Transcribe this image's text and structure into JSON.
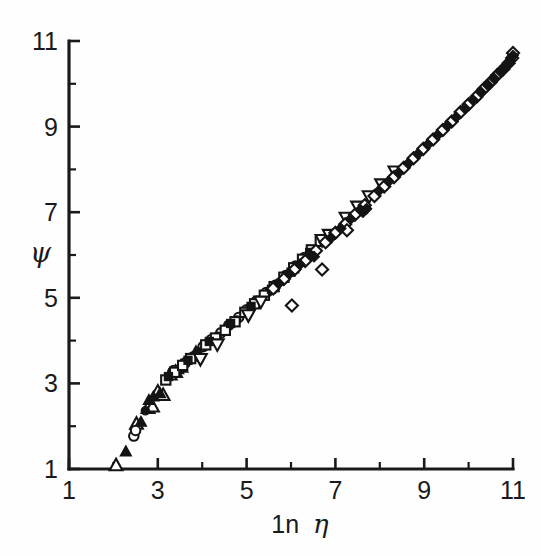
{
  "figure": {
    "background_color": "#fefefe",
    "ink_color": "#1a1a1a"
  },
  "chart_data": {
    "type": "scatter",
    "title": "",
    "subtitle": "",
    "xlabel": "1n η",
    "ylabel": "ψ",
    "xlim": [
      1,
      11
    ],
    "ylim": [
      1,
      11
    ],
    "x_major_ticks": [
      1,
      3,
      5,
      7,
      9,
      11
    ],
    "x_minor_ticks": [
      2,
      4,
      6,
      8,
      10
    ],
    "y_major_ticks": [
      1,
      3,
      5,
      7,
      9,
      11
    ],
    "y_minor_ticks": [
      2,
      4,
      6,
      8,
      10
    ],
    "x_tick_labels": [
      "1",
      "3",
      "5",
      "7",
      "9",
      "11"
    ],
    "y_tick_labels": [
      "1",
      "3",
      "5",
      "7",
      "9",
      "11"
    ],
    "grid": false,
    "legend": null,
    "legend_position": "none",
    "annotations": [],
    "marker_types": [
      "open-triangle-up",
      "filled-triangle-up",
      "open-circle",
      "filled-circle",
      "open-square",
      "filled-square",
      "open-diamond",
      "filled-diamond",
      "open-triangle-down"
    ],
    "series": [
      {
        "name": "open-triangle-up",
        "marker": "open-triangle-up",
        "points": [
          [
            2.06,
            1.1
          ],
          [
            2.52,
            2.07
          ],
          [
            2.78,
            2.44
          ],
          [
            2.88,
            2.47
          ],
          [
            3.0,
            2.82
          ],
          [
            3.12,
            2.74
          ],
          [
            3.28,
            3.22
          ],
          [
            3.4,
            3.28
          ],
          [
            3.52,
            3.4
          ],
          [
            3.86,
            3.72
          ]
        ]
      },
      {
        "name": "filled-triangle-up",
        "marker": "filled-triangle-up",
        "points": [
          [
            2.28,
            1.42
          ],
          [
            2.62,
            2.11
          ],
          [
            2.8,
            2.62
          ],
          [
            2.9,
            2.7
          ],
          [
            3.05,
            2.78
          ],
          [
            3.3,
            3.26
          ],
          [
            3.46,
            3.34
          ]
        ]
      },
      {
        "name": "open-circle",
        "marker": "open-circle",
        "points": [
          [
            2.46,
            1.77
          ],
          [
            2.5,
            1.9
          ],
          [
            3.36,
            3.3
          ],
          [
            3.62,
            3.48
          ],
          [
            3.8,
            3.62
          ],
          [
            4.02,
            3.86
          ],
          [
            4.2,
            4.02
          ],
          [
            4.42,
            4.18
          ],
          [
            4.6,
            4.36
          ],
          [
            4.82,
            4.54
          ],
          [
            5.0,
            4.72
          ],
          [
            5.22,
            4.92
          ],
          [
            5.44,
            5.12
          ],
          [
            5.66,
            5.3
          ],
          [
            5.88,
            5.52
          ],
          [
            6.1,
            5.74
          ],
          [
            6.3,
            5.94
          ]
        ]
      },
      {
        "name": "filled-circle",
        "marker": "filled-circle",
        "points": [
          [
            2.72,
            2.36
          ],
          [
            3.32,
            3.28
          ],
          [
            3.9,
            3.74
          ],
          [
            4.12,
            3.94
          ],
          [
            4.34,
            4.1
          ],
          [
            4.56,
            4.3
          ],
          [
            4.78,
            4.48
          ],
          [
            5.02,
            4.7
          ],
          [
            5.26,
            4.94
          ],
          [
            5.5,
            5.14
          ],
          [
            5.74,
            5.36
          ],
          [
            5.98,
            5.58
          ]
        ]
      },
      {
        "name": "open-square",
        "marker": "open-square",
        "points": [
          [
            3.18,
            3.08
          ],
          [
            3.38,
            3.26
          ],
          [
            3.56,
            3.42
          ],
          [
            3.74,
            3.58
          ],
          [
            4.08,
            3.9
          ],
          [
            4.3,
            4.06
          ],
          [
            4.52,
            4.24
          ],
          [
            4.74,
            4.44
          ],
          [
            4.96,
            4.66
          ],
          [
            5.18,
            4.86
          ],
          [
            5.4,
            5.06
          ],
          [
            5.62,
            5.26
          ],
          [
            5.84,
            5.48
          ],
          [
            6.06,
            5.7
          ],
          [
            6.26,
            5.9
          ],
          [
            6.46,
            6.12
          ],
          [
            6.66,
            6.32
          ]
        ]
      },
      {
        "name": "filled-square",
        "marker": "filled-square",
        "points": [
          [
            3.24,
            3.16
          ],
          [
            3.68,
            3.54
          ],
          [
            4.16,
            3.98
          ],
          [
            4.64,
            4.4
          ],
          [
            5.1,
            4.8
          ],
          [
            5.56,
            5.2
          ],
          [
            6.0,
            5.6
          ],
          [
            6.42,
            6.06
          ]
        ]
      },
      {
        "name": "open-triangle-down",
        "marker": "open-triangle-down",
        "points": [
          [
            3.96,
            3.56
          ],
          [
            4.34,
            3.9
          ],
          [
            5.04,
            4.58
          ],
          [
            5.32,
            4.9
          ],
          [
            6.7,
            6.34
          ],
          [
            6.86,
            6.46
          ],
          [
            7.24,
            6.86
          ],
          [
            7.5,
            7.12
          ],
          [
            7.76,
            7.36
          ],
          [
            8.04,
            7.64
          ],
          [
            8.34,
            7.94
          ]
        ]
      },
      {
        "name": "open-diamond",
        "marker": "open-diamond",
        "points": [
          [
            5.6,
            5.22
          ],
          [
            5.84,
            5.44
          ],
          [
            6.08,
            5.66
          ],
          [
            6.32,
            5.86
          ],
          [
            6.56,
            6.1
          ],
          [
            6.78,
            6.3
          ],
          [
            7.0,
            6.52
          ],
          [
            7.22,
            6.72
          ],
          [
            7.44,
            6.94
          ],
          [
            7.66,
            7.16
          ],
          [
            7.88,
            7.38
          ],
          [
            8.1,
            7.6
          ],
          [
            8.32,
            7.82
          ],
          [
            8.54,
            8.04
          ],
          [
            8.76,
            8.26
          ],
          [
            8.98,
            8.48
          ],
          [
            9.2,
            8.7
          ],
          [
            9.42,
            8.92
          ],
          [
            9.62,
            9.12
          ],
          [
            9.82,
            9.34
          ],
          [
            10.0,
            9.52
          ],
          [
            10.18,
            9.7
          ],
          [
            10.34,
            9.88
          ],
          [
            10.5,
            10.04
          ],
          [
            10.64,
            10.2
          ],
          [
            10.78,
            10.34
          ],
          [
            10.9,
            10.48
          ],
          [
            10.98,
            10.6
          ],
          [
            11.0,
            10.72
          ]
        ]
      },
      {
        "name": "open-diamond-outliers",
        "marker": "open-diamond",
        "points": [
          [
            6.02,
            4.82
          ],
          [
            6.7,
            5.66
          ],
          [
            7.26,
            6.58
          ]
        ]
      },
      {
        "name": "filled-diamond",
        "marker": "filled-diamond",
        "points": [
          [
            5.72,
            5.34
          ],
          [
            5.96,
            5.56
          ],
          [
            6.2,
            5.78
          ],
          [
            6.44,
            6.0
          ],
          [
            6.52,
            5.96
          ],
          [
            6.9,
            6.4
          ],
          [
            7.12,
            6.62
          ],
          [
            7.34,
            6.84
          ],
          [
            7.56,
            7.06
          ],
          [
            7.62,
            7.0
          ],
          [
            7.7,
            7.08
          ],
          [
            7.98,
            7.5
          ],
          [
            8.2,
            7.72
          ],
          [
            8.42,
            7.92
          ],
          [
            8.64,
            8.14
          ],
          [
            8.86,
            8.36
          ],
          [
            9.08,
            8.58
          ],
          [
            9.3,
            8.8
          ],
          [
            9.52,
            9.02
          ],
          [
            9.72,
            9.22
          ],
          [
            9.92,
            9.42
          ],
          [
            10.1,
            9.62
          ],
          [
            10.28,
            9.8
          ],
          [
            10.44,
            9.96
          ],
          [
            10.58,
            10.12
          ],
          [
            10.72,
            10.28
          ],
          [
            10.84,
            10.42
          ],
          [
            10.94,
            10.54
          ],
          [
            11.0,
            10.66
          ]
        ]
      }
    ]
  }
}
